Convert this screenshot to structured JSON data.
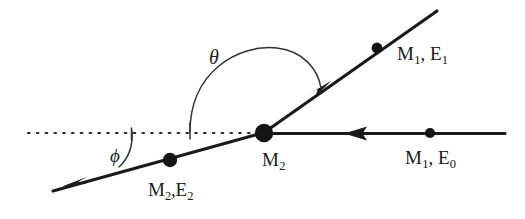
{
  "diagram": {
    "type": "vector-diagram",
    "background_color": "#ffffff",
    "stroke_color": "#1a1a1a",
    "labels": {
      "incident_particle": {
        "mass": "M",
        "mass_sub": "1",
        "energy": "E",
        "energy_sub": "0",
        "text": "M1, E0"
      },
      "scattered_particle": {
        "mass": "M",
        "mass_sub": "1",
        "energy": "E",
        "energy_sub": "1",
        "text": "M1, E1"
      },
      "target_particle": {
        "mass": "M",
        "mass_sub": "2",
        "text": "M2"
      },
      "recoil_particle": {
        "mass": "M",
        "mass_sub": "2",
        "energy": "E",
        "energy_sub": "2",
        "text": "M2,E2"
      },
      "scattering_angle": "θ",
      "recoil_angle": "ϕ"
    },
    "geometry": {
      "vertex": {
        "x": 264,
        "y": 133,
        "radius": 9
      },
      "axis_line": {
        "x1": 505,
        "y1": 133,
        "x2": 264,
        "y2": 133
      },
      "axis_dot": {
        "x": 430,
        "y": 133,
        "radius": 5
      },
      "axis_arrow": {
        "x": 355,
        "y": 133,
        "direction": "left"
      },
      "scattered_ray": {
        "x1": 264,
        "y1": 133,
        "x2": 437,
        "y2": 12
      },
      "scattered_dot": {
        "x": 377,
        "y": 48,
        "radius": 5
      },
      "scattered_arrow": {
        "x": 322,
        "y": 87,
        "direction": "up-right"
      },
      "recoil_ray": {
        "x1": 264,
        "y1": 133,
        "x2": 53,
        "y2": 191
      },
      "recoil_dot": {
        "x": 170,
        "y": 160,
        "radius": 7
      },
      "recoil_arrow": {
        "x": 80,
        "y": 183,
        "direction": "down-left"
      },
      "dotted_axis": {
        "x1": 28,
        "y1": 133,
        "x2": 264,
        "y2": 133,
        "dash": "2 7"
      },
      "theta_arc": {
        "start_x": 190,
        "start_y": 133,
        "end_x": 319,
        "end_y": 90
      },
      "theta_tick": {
        "x": 190,
        "y1": 124,
        "y2": 140
      },
      "phi_arc": {
        "start_x": 131,
        "start_y": 133,
        "end_x": 122,
        "end_y": 168
      },
      "phi_tick": {
        "x": 131,
        "y1": 129,
        "y2": 140
      }
    }
  }
}
